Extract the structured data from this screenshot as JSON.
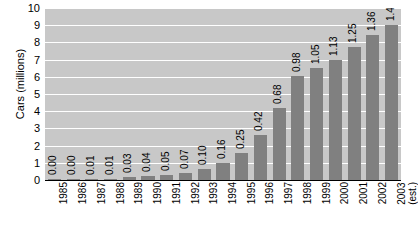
{
  "chart_data": {
    "type": "bar",
    "title": "",
    "xlabel": "",
    "ylabel": "Cars (millions)",
    "ylim": [
      0,
      10
    ],
    "ytick_labels": [
      "10",
      "9",
      "8",
      "7",
      "6",
      "5",
      "4",
      "3",
      "2",
      "1",
      "0"
    ],
    "ytick_values": [
      10,
      9,
      8,
      7,
      6,
      5,
      4,
      3,
      2,
      1,
      0
    ],
    "grid": true,
    "legend": "none",
    "categories": [
      "1985",
      "1986",
      "1987",
      "1988",
      "1989",
      "1990",
      "1991",
      "1992",
      "1993",
      "1994",
      "1995",
      "1996",
      "1997",
      "1998",
      "1999",
      "2000",
      "2001",
      "2002",
      "2003"
    ],
    "category_sublabels": [
      "",
      "",
      "",
      "",
      "",
      "",
      "",
      "",
      "",
      "",
      "",
      "",
      "",
      "",
      "",
      "",
      "",
      "",
      "(est.)"
    ],
    "values": [
      0.0,
      0.0,
      0.01,
      0.01,
      0.03,
      0.04,
      0.05,
      0.07,
      0.1,
      0.16,
      0.25,
      0.42,
      0.68,
      0.98,
      1.05,
      1.13,
      1.25,
      1.36,
      1.45
    ],
    "value_labels": [
      "0.00",
      "0.00",
      "0.01",
      "0.01",
      "0.03",
      "0.04",
      "0.05",
      "0.07",
      "0.10",
      "0.16",
      "0.25",
      "0.42",
      "0.68",
      "0.98",
      "1.05",
      "1.13",
      "1.25",
      "1.36",
      "1.45"
    ],
    "bar_heights_axis_units": [
      0.02,
      0.02,
      0.06,
      0.06,
      0.19,
      0.25,
      0.31,
      0.43,
      0.62,
      0.99,
      1.55,
      2.6,
      4.21,
      6.07,
      6.51,
      7.0,
      7.75,
      8.43,
      8.99
    ],
    "colors": {
      "bar": "#808080",
      "plot_background": "#c8c8c8",
      "gridline": "#ffffff",
      "axis": "#000000",
      "page_background": "#ffffff",
      "text": "#000000"
    }
  }
}
